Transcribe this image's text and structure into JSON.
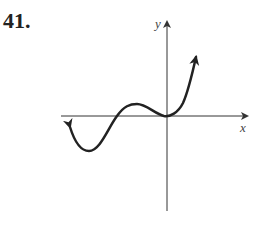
{
  "problem": {
    "number": "41."
  },
  "graph": {
    "x_axis_label": "x",
    "y_axis_label": "y",
    "curve": "polynomial with root at negative x, local max between, touches origin (double root), rising to the right",
    "axis_color": "#333333",
    "curve_color": "#222222"
  }
}
